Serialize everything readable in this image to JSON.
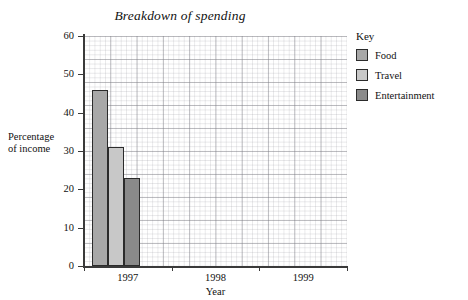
{
  "chart_data": {
    "type": "bar",
    "title": "Breakdown of spending",
    "xlabel": "Year",
    "ylabel": "Percentage of income",
    "ylabel_lines": [
      "Percentage",
      "of income"
    ],
    "categories": [
      "1997",
      "1998",
      "1999"
    ],
    "series": [
      {
        "name": "Food",
        "values": [
          46,
          null,
          null
        ],
        "color": "#a8a8a8"
      },
      {
        "name": "Travel",
        "values": [
          31,
          null,
          null
        ],
        "color": "#c8c8c8"
      },
      {
        "name": "Entertainment",
        "values": [
          23,
          null,
          null
        ],
        "color": "#8a8a8a"
      }
    ],
    "ylim": [
      0,
      60
    ],
    "yticks": [
      0,
      10,
      20,
      30,
      40,
      50,
      60
    ],
    "ytick_labels": [
      "0",
      "10",
      "20",
      "30",
      "40",
      "50",
      "60"
    ],
    "grid": true,
    "grid_style": "graph-paper",
    "legend_position": "right",
    "legend_title": "Key"
  },
  "legend": {
    "title": "Key",
    "entries": [
      {
        "label": "Food",
        "color": "#a8a8a8"
      },
      {
        "label": "Travel",
        "color": "#c8c8c8"
      },
      {
        "label": "Entertainment",
        "color": "#8a8a8a"
      }
    ]
  }
}
